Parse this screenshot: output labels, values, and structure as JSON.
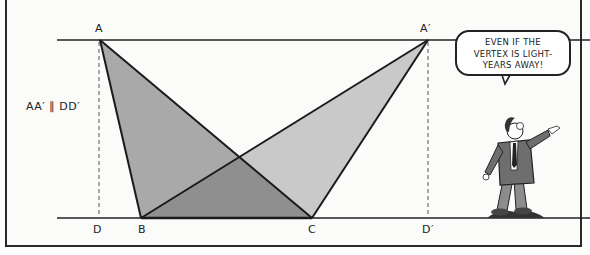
{
  "diagram": {
    "parallel_note": "AA′ ∥ DD′",
    "points": {
      "A": {
        "label": "A",
        "x": 100,
        "y": 40
      },
      "A_prime": {
        "label": "A′",
        "x": 428,
        "y": 40
      },
      "B": {
        "label": "B",
        "x": 141,
        "y": 218
      },
      "C": {
        "label": "C",
        "x": 312,
        "y": 218
      },
      "D": {
        "label": "D",
        "x": 99,
        "y": 218
      },
      "D_prime": {
        "label": "D′",
        "x": 428,
        "y": 218
      }
    },
    "lines": {
      "top_parallel": {
        "x1": 57,
        "x2": 590,
        "y": 40
      },
      "bottom_parallel": {
        "x1": 57,
        "x2": 590,
        "y": 218
      }
    },
    "triangles": [
      {
        "name": "ABC",
        "fill": "#a9a9a9"
      },
      {
        "name": "A′BC",
        "fill": "#c9c9c9"
      }
    ],
    "overlap_fill": "#8f8f8f",
    "speech_bubble": {
      "lines": [
        "EVEN IF THE",
        "VERTEX IS LIGHT-",
        "YEARS AWAY!"
      ]
    },
    "character": "cartoon-man-pointing-right"
  }
}
